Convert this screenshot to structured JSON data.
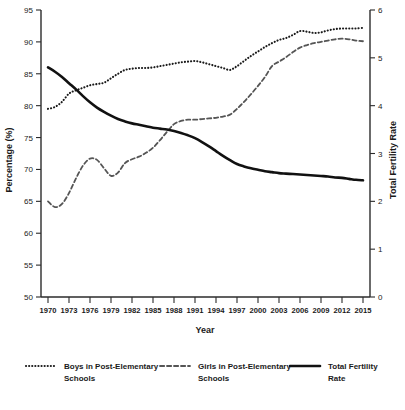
{
  "chart_data": {
    "type": "line",
    "title": "",
    "xlabel": "Year",
    "ylabel": "Percentage (%)",
    "y2label": "Total Fertility Rate",
    "ylim": [
      50,
      95
    ],
    "y2lim": [
      0,
      6
    ],
    "xlim": [
      1969,
      2016
    ],
    "grid": false,
    "legend_position": "bottom",
    "yticks": [
      50,
      55,
      60,
      65,
      70,
      75,
      80,
      85,
      90,
      95
    ],
    "y2ticks": [
      0,
      1,
      2,
      3,
      4,
      5,
      6
    ],
    "xticks": [
      1970,
      1973,
      1976,
      1979,
      1982,
      1985,
      1988,
      1991,
      1994,
      1997,
      2000,
      2003,
      2006,
      2009,
      2012,
      2015
    ],
    "x": [
      1970,
      1971,
      1972,
      1973,
      1974,
      1975,
      1976,
      1977,
      1978,
      1979,
      1980,
      1981,
      1982,
      1983,
      1984,
      1985,
      1986,
      1987,
      1988,
      1989,
      1990,
      1991,
      1992,
      1993,
      1994,
      1995,
      1996,
      1997,
      1998,
      1999,
      2000,
      2001,
      2002,
      2003,
      2004,
      2005,
      2006,
      2007,
      2008,
      2009,
      2010,
      2011,
      2012,
      2013,
      2014,
      2015
    ],
    "series": [
      {
        "name": "Boys in Post-Elementary Schools",
        "axis": "left",
        "style": "dotted",
        "color": "#1a1a1a",
        "unit": "%",
        "values": [
          79.5,
          79.8,
          80.6,
          81.9,
          82.4,
          82.8,
          83.2,
          83.4,
          83.6,
          84.3,
          85.0,
          85.6,
          85.8,
          85.9,
          85.9,
          86.0,
          86.2,
          86.4,
          86.6,
          86.8,
          86.9,
          87.0,
          86.8,
          86.5,
          86.2,
          85.9,
          85.6,
          86.2,
          87.0,
          87.8,
          88.5,
          89.2,
          89.8,
          90.3,
          90.6,
          91.1,
          91.7,
          91.6,
          91.4,
          91.5,
          91.8,
          92.0,
          92.1,
          92.1,
          92.1,
          92.2
        ]
      },
      {
        "name": "Girls in Post-Elementary Schools",
        "axis": "left",
        "style": "dashed",
        "color": "#555555",
        "unit": "%",
        "values": [
          65.0,
          64.1,
          64.6,
          66.3,
          68.6,
          70.6,
          71.7,
          71.5,
          70.2,
          69.0,
          69.5,
          71.0,
          71.6,
          72.0,
          72.6,
          73.4,
          74.6,
          75.9,
          77.1,
          77.6,
          77.8,
          77.8,
          77.9,
          78.0,
          78.1,
          78.3,
          78.6,
          79.5,
          80.6,
          81.8,
          83.1,
          84.5,
          86.2,
          86.9,
          87.6,
          88.4,
          89.1,
          89.5,
          89.8,
          90.0,
          90.2,
          90.4,
          90.5,
          90.4,
          90.2,
          90.1
        ]
      },
      {
        "name": "Total Fertility Rate",
        "axis": "right",
        "style": "solid",
        "color": "#111111",
        "unit": "",
        "values": [
          4.8,
          4.71,
          4.6,
          4.47,
          4.34,
          4.2,
          4.07,
          3.96,
          3.87,
          3.79,
          3.72,
          3.67,
          3.63,
          3.6,
          3.57,
          3.54,
          3.52,
          3.5,
          3.47,
          3.43,
          3.38,
          3.32,
          3.24,
          3.15,
          3.05,
          2.95,
          2.86,
          2.78,
          2.73,
          2.69,
          2.66,
          2.63,
          2.61,
          2.59,
          2.58,
          2.57,
          2.56,
          2.55,
          2.54,
          2.53,
          2.52,
          2.5,
          2.49,
          2.47,
          2.45,
          2.44
        ]
      }
    ]
  },
  "legend": {
    "items": [
      {
        "label_line1": "Boys in Post-Elementary",
        "label_line2": "Schools",
        "style": "dotted"
      },
      {
        "label_line1": "Girls in Post-Elementary",
        "label_line2": "Schools",
        "style": "dashed"
      },
      {
        "label_line1": "Total Fertility",
        "label_line2": "Rate",
        "style": "solid"
      }
    ]
  }
}
